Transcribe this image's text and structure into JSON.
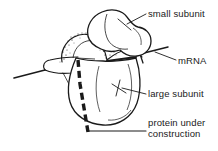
{
  "figure": {
    "background_color": "#ffffff",
    "ink_color": "#1a1a1a"
  },
  "labels": {
    "small_subunit": "small subunit",
    "mrna": "mRNA",
    "large_subunit": "large subunit",
    "protein_line1": "protein under",
    "protein_line2": "construction"
  },
  "structures": {
    "small_subunit_name": "small-subunit-shape",
    "large_subunit_name": "large-subunit-shape",
    "mrna_name": "mrna-strand",
    "protein_name": "nascent-protein-chain",
    "stipple_name": "subunit-interface-stipple",
    "trna_name": "trna-arm-shape"
  }
}
